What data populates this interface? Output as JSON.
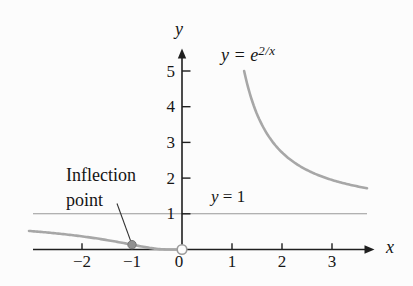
{
  "figure": {
    "background": "#fcfcfc",
    "axis_color": "#1f1f1f",
    "text_color": "#161616",
    "leader_color": "#333333"
  },
  "chart_data": {
    "type": "line",
    "xlabel": "x",
    "ylabel": "y",
    "xlim": [
      -3.1,
      3.85
    ],
    "ylim": [
      0,
      5.6
    ],
    "grid": false,
    "legend_position": "none",
    "x_tick_labels": [
      {
        "v": -2,
        "t": "−2"
      },
      {
        "v": -1,
        "t": "−1"
      },
      {
        "v": 0,
        "t": "0"
      },
      {
        "v": 1,
        "t": "1"
      },
      {
        "v": 2,
        "t": "2"
      },
      {
        "v": 3,
        "t": "3"
      }
    ],
    "y_tick_labels": [
      {
        "v": 1,
        "t": "1"
      },
      {
        "v": 2,
        "t": "2"
      },
      {
        "v": 3,
        "t": "3"
      },
      {
        "v": 4,
        "t": "4"
      },
      {
        "v": 5,
        "t": "5"
      }
    ],
    "series": [
      {
        "name": "y = e^(2/x)",
        "expression": "exp(2/x)",
        "color": "#a7a7a7",
        "width": 2.6,
        "branches": [
          [
            -3.06,
            -0.12
          ],
          [
            1.2427,
            3.7
          ]
        ]
      },
      {
        "name": "y = 1",
        "expression": "1",
        "color": "#989898",
        "width": 1.1,
        "branches": [
          [
            -2.98,
            3.7
          ]
        ]
      }
    ],
    "annotations": {
      "curve_label": {
        "prefix": "y = e",
        "sup": "2/x"
      },
      "hline_label": {
        "var": "y",
        "rest": " = 1"
      },
      "inflection": {
        "label": "Inflection point",
        "x": -1,
        "y": 0.1353,
        "dot_fill": "#909090",
        "dot_stroke": "#757575"
      },
      "open_point": {
        "x": 0,
        "y": 0,
        "fill": "#fcfcfc",
        "stroke": "#9b9b9b"
      }
    }
  }
}
